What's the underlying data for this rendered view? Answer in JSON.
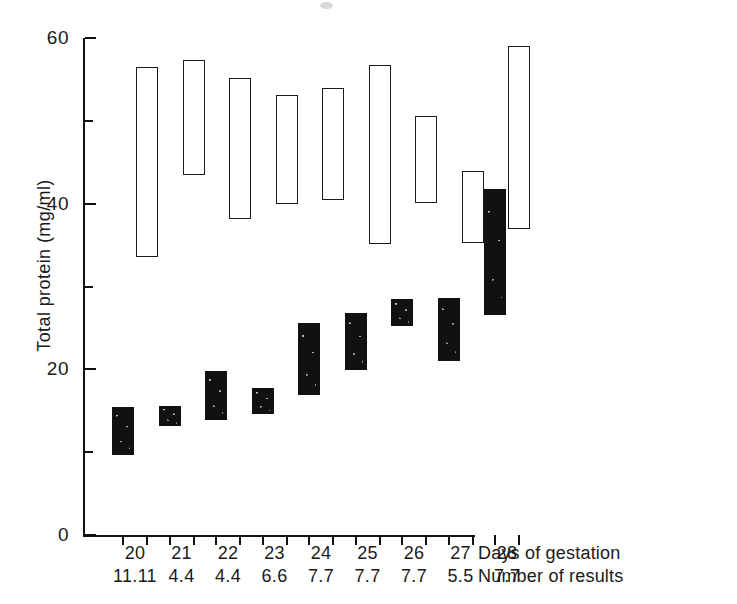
{
  "chart_data": {
    "type": "bar",
    "title": "",
    "subtitle": "",
    "xlabel": "Days of gestation",
    "ylabel": "Total protein (mg/ml)",
    "ylim": [
      0,
      60
    ],
    "y_major_ticks": [
      0,
      20,
      40,
      60
    ],
    "y_minor_ticks": [
      10,
      30,
      50
    ],
    "y_tick_labels": [
      "0",
      "20",
      "40",
      "60"
    ],
    "grid": false,
    "legend": "none",
    "note": "Paired vertical range bars per gestation day: a solid black range bar (lower values) and an open/unfilled range bar (higher values). Each bar spans a min-to-max range of total protein.",
    "categories": [
      "20",
      "21",
      "22",
      "23",
      "24",
      "25",
      "26",
      "27",
      "28"
    ],
    "row_labels": [
      "Days of gestation",
      "Number of results"
    ],
    "number_of_results": [
      "11.11",
      "4.4",
      "4.4",
      "6.6",
      "7.7",
      "7.7",
      "7.7",
      "5.5",
      "7.7"
    ],
    "series": [
      {
        "name": "solid-range",
        "style": "filled",
        "ranges": [
          {
            "category": "20",
            "low": 9.6,
            "high": 15.4
          },
          {
            "category": "21",
            "low": 13.1,
            "high": 15.6
          },
          {
            "category": "22",
            "low": 13.9,
            "high": 19.8
          },
          {
            "category": "23",
            "low": 14.6,
            "high": 17.7
          },
          {
            "category": "24",
            "low": 16.9,
            "high": 25.6
          },
          {
            "category": "25",
            "low": 19.9,
            "high": 26.8
          },
          {
            "category": "26",
            "low": 25.2,
            "high": 28.5
          },
          {
            "category": "27",
            "low": 21.0,
            "high": 28.6
          },
          {
            "category": "28",
            "low": 26.5,
            "high": 41.8
          }
        ]
      },
      {
        "name": "open-range",
        "style": "open",
        "ranges": [
          {
            "category": "20",
            "low": 33.6,
            "high": 56.5
          },
          {
            "category": "21",
            "low": 43.5,
            "high": 57.4
          },
          {
            "category": "22",
            "low": 38.1,
            "high": 55.2
          },
          {
            "category": "23",
            "low": 40.0,
            "high": 53.1
          },
          {
            "category": "24",
            "low": 40.5,
            "high": 54.0
          },
          {
            "category": "25",
            "low": 35.1,
            "high": 56.8
          },
          {
            "category": "26",
            "low": 40.1,
            "high": 50.6
          },
          {
            "category": "27",
            "low": 35.2,
            "high": 44.0
          },
          {
            "category": "28",
            "low": 37.0,
            "high": 59.0
          }
        ]
      }
    ]
  },
  "axes": {
    "y_title": "Total protein (mg/ml)",
    "x_row1_title": "Days of gestation",
    "x_row2_title": "Number of results"
  },
  "y_ticks": [
    {
      "value": "60"
    },
    {
      "value": "40"
    },
    {
      "value": "20"
    },
    {
      "value": "0"
    }
  ],
  "x_groups": [
    {
      "day": "20",
      "results": "11.11"
    },
    {
      "day": "21",
      "results": "4.4"
    },
    {
      "day": "22",
      "results": "4.4"
    },
    {
      "day": "23",
      "results": "6.6"
    },
    {
      "day": "24",
      "results": "7.7"
    },
    {
      "day": "25",
      "results": "7.7"
    },
    {
      "day": "26",
      "results": "7.7"
    },
    {
      "day": "27",
      "results": "5.5"
    },
    {
      "day": "28",
      "results": "7.7"
    }
  ],
  "colors": {
    "ink": "#1a1a1a",
    "filled_bar": "#111111",
    "open_bar_fill": "#ffffff",
    "background": "#ffffff"
  }
}
